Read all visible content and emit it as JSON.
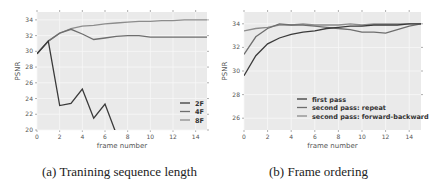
{
  "chart_data": [
    {
      "type": "line",
      "title": "",
      "caption": "(a) Tranining sequence length",
      "xlabel": "frame number",
      "ylabel": "PSNR",
      "xlim": [
        0,
        15
      ],
      "ylim": [
        20,
        35
      ],
      "xticks": [
        0,
        2,
        4,
        6,
        8,
        10,
        12,
        14
      ],
      "yticks": [
        20,
        22,
        24,
        26,
        28,
        30,
        32,
        34
      ],
      "grid": true,
      "legend_position": "lower right",
      "x": [
        0,
        1,
        2,
        3,
        4,
        5,
        6,
        7,
        8,
        9,
        10,
        11,
        12,
        13,
        14,
        15
      ],
      "series": [
        {
          "name": "2F",
          "color": "#3a3a3a",
          "values": [
            29.7,
            31.3,
            23.1,
            23.4,
            25.2,
            21.5,
            23.3,
            19.5,
            null,
            null,
            null,
            null,
            null,
            null,
            null,
            null
          ]
        },
        {
          "name": "4F",
          "color": "#6e6e6e",
          "values": [
            29.7,
            31.3,
            32.3,
            32.8,
            32.2,
            31.5,
            31.7,
            31.9,
            32.0,
            32.0,
            31.8,
            31.8,
            31.8,
            31.8,
            31.8,
            31.8
          ]
        },
        {
          "name": "8F",
          "color": "#8c8c8c",
          "values": [
            29.7,
            31.3,
            32.3,
            32.9,
            33.2,
            33.3,
            33.5,
            33.6,
            33.7,
            33.8,
            33.8,
            33.9,
            33.9,
            34.0,
            34.0,
            34.0
          ]
        }
      ]
    },
    {
      "type": "line",
      "title": "",
      "caption": "(b) Frame ordering",
      "xlabel": "frame number",
      "ylabel": "PSNR",
      "xlim": [
        0,
        15
      ],
      "ylim": [
        25,
        35
      ],
      "xticks": [
        0,
        2,
        4,
        6,
        8,
        10,
        12,
        14
      ],
      "yticks": [
        26,
        28,
        30,
        32,
        34
      ],
      "grid": true,
      "legend_position": "lower right",
      "x": [
        0,
        1,
        2,
        3,
        4,
        5,
        6,
        7,
        8,
        9,
        10,
        11,
        12,
        13,
        14,
        15
      ],
      "series": [
        {
          "name": "first pass",
          "color": "#3a3a3a",
          "values": [
            29.6,
            31.3,
            32.3,
            32.8,
            33.1,
            33.3,
            33.4,
            33.6,
            33.7,
            33.8,
            33.8,
            33.9,
            33.9,
            33.9,
            34.0,
            34.0
          ]
        },
        {
          "name": "second pass: repeat",
          "color": "#6e6e6e",
          "values": [
            31.4,
            32.9,
            33.6,
            34.0,
            33.9,
            33.9,
            33.8,
            33.7,
            33.6,
            33.5,
            33.3,
            33.3,
            33.2,
            33.5,
            33.8,
            34.0
          ]
        },
        {
          "name": "second pass: forward-backward",
          "color": "#8c8c8c",
          "values": [
            33.4,
            33.6,
            33.7,
            33.9,
            33.9,
            34.0,
            33.9,
            33.9,
            33.9,
            34.0,
            33.9,
            34.0,
            34.0,
            34.0,
            34.0,
            34.0
          ]
        }
      ]
    }
  ]
}
